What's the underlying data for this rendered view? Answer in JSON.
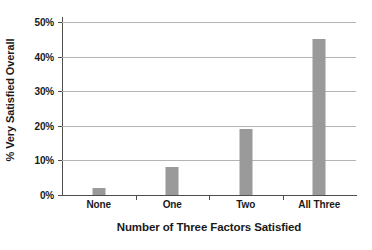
{
  "chart_data": {
    "type": "bar",
    "title": "",
    "subtitle": "",
    "xlabel": "Number of Three Factors Satisfied",
    "ylabel": "% Very Satisfied Overall",
    "categories": [
      "None",
      "One",
      "Two",
      "All Three"
    ],
    "values": [
      2,
      8,
      19,
      45
    ],
    "ylim": [
      0,
      50
    ],
    "ytick_values": [
      0,
      10,
      20,
      30,
      40,
      50
    ],
    "ytick_labels": [
      "0%",
      "10%",
      "20%",
      "30%",
      "40%",
      "50%"
    ],
    "grid": "horizontal",
    "legend": "none",
    "annotations": [],
    "colors": {
      "bar": "#9a9a9a",
      "gridline": "#b4b4b4",
      "axis": "#4d4d4d",
      "text": "#1a1a1a",
      "background": "#ffffff"
    }
  }
}
